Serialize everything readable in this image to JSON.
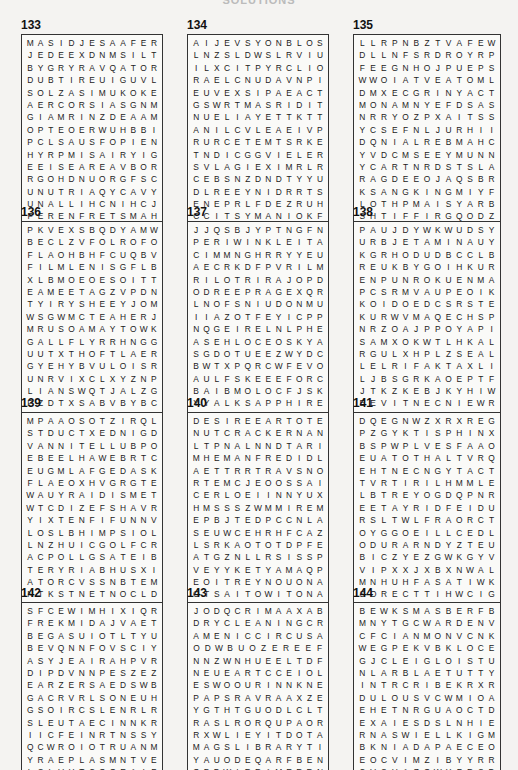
{
  "page_title": "SOLUTIONS",
  "puzzles": [
    {
      "number": "133",
      "rows": [
        "MASIDJESAAFER",
        "JEDEEXDNMSILT",
        "BYGRYRAVQATOR",
        "DUBTIREUIGUVL",
        "SOLZASIMUKOKE",
        "AERCORSIASGNM",
        "GIAMRINZDEAAM",
        "OPTEOERWUHBBI",
        "PCLSAUSFOPIEN",
        "HYRPMISAIRYIG",
        "EEISEAREAVBOR",
        "RGOHDNUORGFSC",
        "UNUTRIAQYCAVY",
        "UNALLIHCNIHCJ",
        "FERENFRETSMAH"
      ]
    },
    {
      "number": "134",
      "rows": [
        "AIJEVSYONBLOS",
        "LNZSLDWSLRVIU",
        "ILXCITPYRCLIO",
        "RAELCNUDAVNPI",
        "EUVEXSIPAEACT",
        "GSWRTMASRIDIT",
        "NUELIAYETTKTT",
        "ANILCVLEAEIVP",
        "RURCETEMTSRKE",
        "TNDICGGVIELER",
        "SVLAGIEXIMRLR",
        "CEBSNZDNDTYYU",
        "DLREEYNIDRRTS",
        "ENEPRLFDEZRUH",
        "CCITSYMANIOKF"
      ]
    },
    {
      "number": "135",
      "rows": [
        "LLRPNBZTVAFEW",
        "DLLNFSRDROYRP",
        "FEEGNHOJPUEPS",
        "WWOIATVEATOML",
        "DMXECGRINYACT",
        "MONAMNYEFDSAS",
        "NRRYOZPXAITSS",
        "YCSEFNLJURHII",
        "DQNIALREBMAHC",
        "YVDCMSEEYMUNN",
        "YCARTNRDSTSLA",
        "RAGDEEOJAQSBR",
        "KSANGKINGMIYF",
        "LOTHPMAISYARB",
        "SHTIFFIRGQODZ"
      ]
    },
    {
      "number": "136",
      "rows": [
        "PKVEXSBQDYAMW",
        "BECLZVFOLROFO",
        "FLAOHBHFCUQBV",
        "FILMLENISGFLB",
        "XLBMOEOESOITT",
        "EAMEETAGZVPDN",
        "TYIRYSHEEYJOM",
        "WSGWMCTEAHERJ",
        "MRUSOAMAYTOWK",
        "GALLFLYRRHNGG",
        "UUTXTHOFTLAER",
        "GYEHYBVULOISR",
        "UNRVIXCLXYZNP",
        "LIANSWQTJALZG",
        "PZDTXSABVBYBC"
      ]
    },
    {
      "number": "137",
      "rows": [
        "JJQSBJYPTNGFN",
        "PERIWINKLEITA",
        "CIMMNGHRRYYEU",
        "AECRKDFPVRILM",
        "RILOTRIRAJOPD",
        "ODREEPRAGEXQRD",
        "LNOFSNIUDONMUO",
        "IIAZOTFEYICPP",
        "NQGEIRELNLPHE",
        "ASEHLOCEOSKYA",
        "SGDOTUEEZWYDC",
        "BWTXPQRCWFEVO",
        "AULFSKEEEFORC",
        "BAIBMOLOCFJSK",
        "YYALKSAPPHIRE"
      ]
    },
    {
      "number": "138",
      "rows": [
        "PAUJDYWKWUDSY",
        "URBJETAMINAUY",
        "KGRHODUDBCCLB",
        "REUKBYGOIHKUR",
        "ENPUNROKUENMA",
        "PCSRMVAUPEOIK",
        "KOIDOEDCSRSTE",
        "KURWVMAQECHSP",
        "NRZOAJPPOYAPI",
        "SAMXOKWTLHKAL",
        "RGULXHPLZSEAL",
        "LELRIFAKTAXLI",
        "LJBSGRKAOEPTF",
        "JTKZKEBJKYHIW",
        "EEVITNECNIEWR"
      ]
    },
    {
      "number": "139",
      "rows": [
        "MPAAOSOTZIRQL",
        "STDUCTXEDNIGD",
        "VANNITELLUBPO",
        "EBEELHAWEBRTC",
        "EUGMLAFGEDASK",
        "FLAEOXHVGRGTE",
        "WAUYRAIDISMET",
        "WTCDIZEFSHAVR",
        "YIXTENFIFUNNV",
        "LOSLBHIMPSIOL",
        "LNZHUICGOLFCR",
        "ACPOLLGSATEIB",
        "TERYRIABHUSXI",
        "ATORCVSSNBTEM",
        "NTKSTNETNOCLD"
      ]
    },
    {
      "number": "140",
      "rows": [
        "DESIREEARTOTE",
        "NUTCRACKERNAN",
        "LTPNALNNDTARI",
        "MHEMANFREDIDL",
        "AETTRRTRAVSNO",
        "RTEMCJEOOSSAI",
        "CERLOEIINNYUXV",
        "HMSSSZWMMIREM",
        "EPBJTEDPCCNLA",
        "SEUWCEHRHFCAZ",
        "LSRKAOTOTDPFE",
        "ATGZNLLRSISSP",
        "VEYYKETYAMAQP",
        "EOITREYNOUONA",
        "OTSAITOWITONA"
      ]
    },
    {
      "number": "141",
      "rows": [
        "DQEGNWZXRXREG",
        "PZGYKTISPHINX",
        "BSPWPLVESFAAO",
        "EUATOTHALTVRQ",
        "EHTNECNGYTACT",
        "TVRTIRILHMMLE",
        "LBTREYOGDQPNR",
        "EETAYRIDFEIDU",
        "RSLTWLFRAORCT",
        "OYGGOEILLCEDL",
        "ODURARNDYZTEU",
        "BICZYEZGWKGYV",
        "VIPXXJXBXNWAL",
        "MNHUHFASATIWK",
        "SORECTTIHWCIG"
      ]
    },
    {
      "number": "142",
      "rows": [
        "SFCEWIMHIXIQR",
        "FREKMIDAJVAET",
        "BEGASUIOTLTYU",
        "BEVQNNFOVSCIY",
        "ASYJEAIRAHPVR",
        "DIPDVNNPESZEZ",
        "EARZERSAEDSWB",
        "GACRVRLSONEUH",
        "GSOIRCSLENRLR",
        "SLEUTAECINNKR",
        "IICFEINRTNSSY",
        "QCWROIOTRUANM",
        "YRAEPLASMNTVE",
        "LSLVHTCOQEAIF",
        "XORCRZAQSUTML"
      ]
    },
    {
      "number": "143",
      "rows": [
        "JODQCRIMAAXAB",
        "DRYCLEANINGCR",
        "AMENICCIRCUSA",
        "ODWBUOZEREEF",
        "NNZWNHUEELTDF",
        "NEUEARTCCEIOL",
        "ESWOOURINNKNE",
        "PAPSRAVRAAXZE",
        "YGTHTGUODLCLT",
        "RASLRORQUPAOR",
        "RXWLIEYITDOTA",
        "MAGSLIBRARYTI",
        "YAUODEQARFBEN",
        "OBDWIRRAMERRN",
        "PEPDLRCYLCFYA"
      ]
    },
    {
      "number": "144",
      "rows": [
        "BEWKSMASBERFB",
        "MNYTGCWARDENV",
        "CFCIANMONVCNK",
        "WEGPEKVBKLOCE",
        "GJCLEIGLOISTU",
        "NLARBLAETUTTY",
        "INTRCRIBEKRXR",
        "DULOUSVCWMIOA",
        "EHETNRGUAOCTD",
        "EXAIESDSLNHIE",
        "RNASWIELLKIGM",
        "BKNIADAPAECEO",
        "EOCVIMZIBYYRR",
        "CVSUAZQWYFRSD",
        "FTGELBARENLUV"
      ]
    }
  ]
}
